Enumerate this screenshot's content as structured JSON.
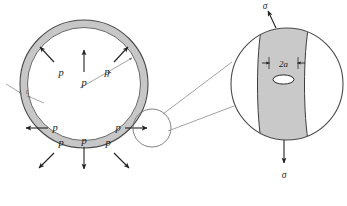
{
  "figure": {
    "background_color": "#ffffff"
  },
  "colors": {
    "wall_fill": "#c7c7c7",
    "band_fill": "#c9c9c9",
    "outline": "#4a4a4a",
    "arrow": "#222222",
    "leader": "#8c8c8c",
    "crack_fill": "#ffffff"
  },
  "vessel": {
    "name": "pressure-vessel-cross-section",
    "radius_label": "r",
    "thickness_label": "t",
    "pressure_labels": [
      {
        "id": "p-top",
        "text": "p"
      },
      {
        "id": "p-upper-right",
        "text": "p"
      },
      {
        "id": "p-right",
        "text": "p"
      },
      {
        "id": "p-lower-right",
        "text": "p"
      },
      {
        "id": "p-bottom",
        "text": "p"
      },
      {
        "id": "p-lower-left",
        "text": "p"
      },
      {
        "id": "p-left",
        "text": "p"
      },
      {
        "id": "p-upper-left",
        "text": "p"
      }
    ]
  },
  "detail": {
    "name": "crack-detail-view",
    "crack_length_label": "2a",
    "stress_top_label": "σ",
    "stress_bottom_label": "σ"
  }
}
